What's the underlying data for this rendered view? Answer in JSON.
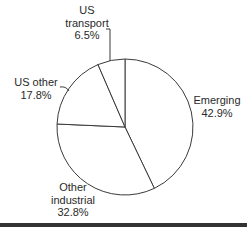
{
  "chart_data": {
    "type": "pie",
    "title": "",
    "start_angle": "12 o'clock",
    "direction": "clockwise",
    "slices": [
      {
        "label": "Emerging",
        "value": 42.9,
        "display": "42.9%",
        "color": "#ffffff"
      },
      {
        "label": "Other industrial",
        "value": 32.8,
        "display": "32.8%",
        "color": "#ffffff"
      },
      {
        "label": "US other",
        "value": 17.8,
        "display": "17.8%",
        "color": "#ffffff"
      },
      {
        "label": "US transport",
        "value": 6.5,
        "display": "6.5%",
        "color": "#ffffff"
      }
    ],
    "categories": [
      "Emerging",
      "Other industrial",
      "US other",
      "US transport"
    ],
    "values": [
      42.9,
      32.8,
      17.8,
      6.5
    ],
    "stroke_color": "#3a3a3a",
    "legend": "none (labels placed beside slices)"
  },
  "labels": {
    "us_transport": {
      "line1": "US",
      "line2": "transport",
      "value": "6.5%"
    },
    "us_other": {
      "line1": "US other",
      "value": "17.8%"
    },
    "emerging": {
      "line1": "Emerging",
      "value": "42.9%"
    },
    "other_industrial": {
      "line1": "Other",
      "line2": "industrial",
      "value": "32.8%"
    }
  }
}
